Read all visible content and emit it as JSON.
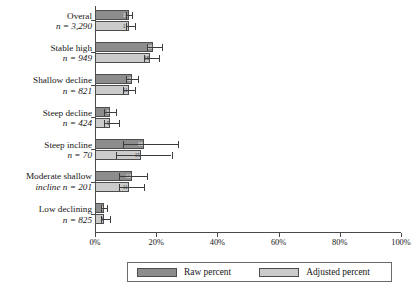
{
  "chart_data": {
    "type": "bar",
    "orientation": "horizontal",
    "title": "",
    "xlabel": "",
    "ylabel": "",
    "xlim": [
      0,
      100
    ],
    "xticks": [
      "0%",
      "20%",
      "40%",
      "60%",
      "80%",
      "100%"
    ],
    "xtick_values": [
      0,
      20,
      40,
      60,
      80,
      100
    ],
    "grid": false,
    "legend_position": "bottom",
    "categories": [
      {
        "name": "Overal",
        "n": "n = 3,290"
      },
      {
        "name": "Stable high",
        "n": "n = 949"
      },
      {
        "name": "Shallow decline",
        "n": "n = 821"
      },
      {
        "name": "Steep decline",
        "n": "n = 424"
      },
      {
        "name": "Steep incline",
        "n": "n = 70"
      },
      {
        "name": "Moderate shallow incline",
        "n": "n = 201"
      },
      {
        "name": "Low declining",
        "n": "n = 825"
      }
    ],
    "series": [
      {
        "name": "Raw percent",
        "color": "#8d8d8d",
        "values": [
          11,
          19,
          12,
          5,
          16,
          12,
          3
        ],
        "labels": [
          "11",
          "19",
          "12",
          "5",
          "16",
          "12",
          "3"
        ],
        "ci_low": [
          10,
          17,
          10,
          3,
          9,
          8,
          2
        ],
        "ci_high": [
          12,
          22,
          14,
          7,
          27,
          17,
          4
        ]
      },
      {
        "name": "Adjusted percent",
        "color": "#cbcbcb",
        "values": [
          11,
          18,
          11,
          5,
          15,
          11,
          3
        ],
        "labels": [
          "11",
          "18",
          "11",
          "5",
          "15",
          "11",
          "3"
        ],
        "ci_low": [
          10,
          16,
          9,
          3,
          7,
          8,
          2
        ],
        "ci_high": [
          13,
          21,
          13,
          8,
          25,
          16,
          5
        ]
      }
    ]
  },
  "legend": {
    "raw_label": "Raw percent",
    "adjusted_label": "Adjusted percent"
  }
}
